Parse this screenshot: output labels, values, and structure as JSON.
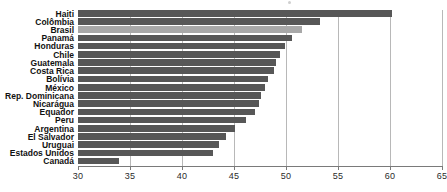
{
  "chart_data": {
    "type": "bar",
    "orientation": "horizontal",
    "title": "",
    "subtitle": "",
    "xlabel": "",
    "ylabel": "",
    "xlim": [
      30,
      65
    ],
    "grid": true,
    "gridlines": [
      35,
      40,
      45,
      50,
      55,
      60,
      65
    ],
    "xticks": [
      30,
      35,
      40,
      45,
      50,
      55,
      60,
      65
    ],
    "xtick_labels": [
      "30",
      "35",
      "40",
      "45",
      "50",
      "55",
      "60",
      "65"
    ],
    "legend": null,
    "legend_position": "none",
    "highlight_category": "Brasil",
    "colors": {
      "bar": "#575757",
      "bar_highlight": "#a8a8a8",
      "gridline": "#b8b8b8",
      "axis": "#7a7a7a",
      "label_text": "#111111",
      "tick_text": "#2b2b2b",
      "background": "#ffffff"
    },
    "categories": [
      "Haiti",
      "Colômbia",
      "Brasil",
      "Panamá",
      "Honduras",
      "Chile",
      "Guatemala",
      "Costa Rica",
      "Bolívia",
      "México",
      "Rep. Dominicana",
      "Nicarágua",
      "Equador",
      "Peru",
      "Argentina",
      "El Salvador",
      "Uruguai",
      "Estados Unidos",
      "Canadá"
    ],
    "values": [
      60.2,
      53.3,
      51.5,
      50.6,
      49.9,
      49.4,
      49.0,
      48.8,
      48.3,
      48.0,
      47.6,
      47.4,
      47.0,
      46.2,
      45.1,
      44.2,
      43.6,
      43.0,
      33.9
    ]
  }
}
